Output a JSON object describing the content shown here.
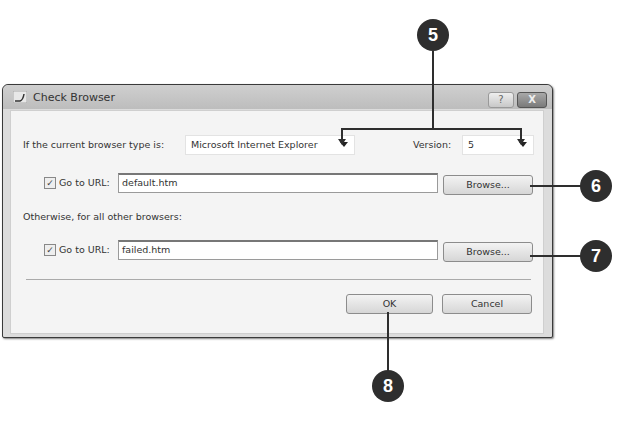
{
  "window": {
    "title": "Check Browser",
    "help_button": "?",
    "close_button": "X"
  },
  "browser_row": {
    "label": "If the current browser type is:",
    "browser_select_value": "Microsoft Internet Explorer",
    "version_label": "Version:",
    "version_select_value": "5"
  },
  "first_url": {
    "checked": true,
    "check_glyph": "✓",
    "label": "Go to URL:",
    "value": "default.htm",
    "browse_label": "Browse..."
  },
  "otherwise_label": "Otherwise, for all other browsers:",
  "second_url": {
    "checked": true,
    "check_glyph": "✓",
    "label": "Go to URL:",
    "value": "failed.htm",
    "browse_label": "Browse..."
  },
  "footer": {
    "ok_label": "OK",
    "cancel_label": "Cancel"
  },
  "callouts": [
    {
      "number": "5"
    },
    {
      "number": "6"
    },
    {
      "number": "7"
    },
    {
      "number": "8"
    }
  ]
}
